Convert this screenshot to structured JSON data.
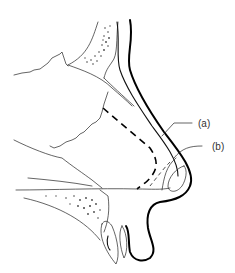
{
  "figure": {
    "type": "anatomical line drawing",
    "labels": [
      {
        "id": "a",
        "text": "(a)"
      },
      {
        "id": "b",
        "text": "(b)"
      }
    ],
    "colors": {
      "background": "#ffffff",
      "line": "#000000",
      "label_text": "#333333"
    }
  }
}
